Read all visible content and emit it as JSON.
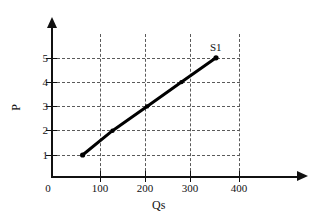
{
  "chart_data": {
    "type": "line",
    "title": "",
    "xlabel": "Qs",
    "ylabel": "P",
    "xlim": [
      0,
      450
    ],
    "ylim": [
      0,
      5.6
    ],
    "x_ticks": [
      0,
      100,
      200,
      300,
      400
    ],
    "x_tick_labels": [
      "0",
      "100",
      "200",
      "300",
      "400"
    ],
    "y_ticks": [
      1,
      2,
      3,
      4,
      5
    ],
    "y_tick_labels": [
      "1",
      "2",
      "3",
      "4",
      "5"
    ],
    "grid": true,
    "grid_style": "dashed",
    "legend_position": "inline-endpoint",
    "series": [
      {
        "name": "S1",
        "label": "S1",
        "color": "#000000",
        "x": [
          60,
          125,
          200,
          275,
          350
        ],
        "y": [
          1,
          2,
          3,
          4,
          5
        ],
        "markers": true
      }
    ],
    "annotations": [
      {
        "text": "S1",
        "x": 355,
        "y": 5.35
      }
    ]
  },
  "axes": {
    "y_title": "P",
    "x_title": "Qs",
    "x_tick_labels": [
      "0",
      "100",
      "200",
      "300",
      "400"
    ],
    "y_tick_labels": [
      "1",
      "2",
      "3",
      "4",
      "5"
    ]
  },
  "colors": {
    "series": "#000000",
    "axis": "#111111",
    "grid": "#5a5a5a",
    "background": "#ffffff"
  }
}
